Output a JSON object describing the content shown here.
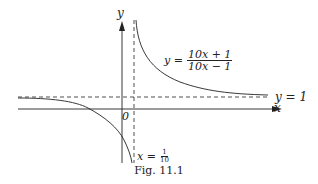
{
  "figure": {
    "caption": "Fig. 11.1",
    "axes": {
      "x_label": "x",
      "y_label": "y",
      "origin_label": "0"
    },
    "curve": {
      "lhs": "y =",
      "numerator": "10x + 1",
      "denominator": "10x − 1"
    },
    "horizontal_asymptote": {
      "label": "y = 1"
    },
    "vertical_asymptote": {
      "lhs": "x =",
      "numerator": "1",
      "denominator": "10"
    }
  }
}
